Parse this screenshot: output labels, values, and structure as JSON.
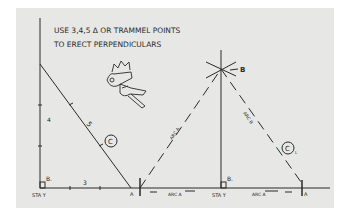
{
  "note": {
    "line1": "USE 3,4,5 Δ OR TRAMMEL POINTS",
    "line2": "TO ERECT PERPENDICULARS"
  },
  "left_triangle": {
    "side_vertical": "4",
    "side_hypotenuse": "5",
    "side_base": "3",
    "circle_label": "C",
    "angle_label": "B.",
    "station_label": "STA Y",
    "point_label": "A"
  },
  "right_triangle": {
    "apex_label": "B",
    "arc_left_label": "ARC A",
    "arc_right_label": "ARC B",
    "base_arc_left": "ARC A",
    "base_arc_right": "ARC A",
    "circle_label": "C",
    "circle_subscript": "L",
    "angle_label": "B.",
    "station_label": "STA Y",
    "point_label": "A"
  },
  "colors": {
    "paper": "#e7e7e5",
    "ink": "#2a2a2a"
  }
}
